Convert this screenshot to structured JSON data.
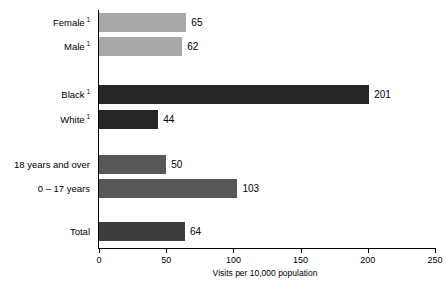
{
  "chart_data": {
    "type": "bar",
    "orientation": "horizontal",
    "title": "",
    "xlabel": "Visits per 10,000 population",
    "ylabel": "",
    "xlim": [
      0,
      250
    ],
    "xticks": [
      0,
      50,
      100,
      150,
      200,
      250
    ],
    "grid": false,
    "legend": false,
    "categories": [
      "Female",
      "Male",
      "Black",
      "White",
      "18 years and over",
      "0 – 17 years",
      "Total"
    ],
    "values": [
      65,
      62,
      201,
      44,
      50,
      103,
      64
    ],
    "footnote_markers": [
      "1",
      "1",
      "1",
      "1",
      "",
      "",
      ""
    ],
    "bar_colors": [
      "#a8a8a8",
      "#a8a8a8",
      "#262626",
      "#262626",
      "#585858",
      "#585858",
      "#3d3d3d"
    ],
    "bars": [
      {
        "label": "Female",
        "marker": "1",
        "value": 65,
        "value_text": "65",
        "color": "#a8a8a8",
        "top": 13
      },
      {
        "label": "Male",
        "marker": "1",
        "value": 62,
        "value_text": "62",
        "color": "#a8a8a8",
        "top": 37
      },
      {
        "label": "Black",
        "marker": "1",
        "value": 201,
        "value_text": "201",
        "color": "#262626",
        "top": 85
      },
      {
        "label": "White",
        "marker": "1",
        "value": 44,
        "value_text": "44",
        "color": "#262626",
        "top": 110
      },
      {
        "label": "18 years and over",
        "marker": "",
        "value": 50,
        "value_text": "50",
        "color": "#585858",
        "top": 155
      },
      {
        "label": "0 – 17 years",
        "marker": "",
        "value": 103,
        "value_text": "103",
        "color": "#585858",
        "top": 179
      },
      {
        "label": "Total",
        "marker": "",
        "value": 64,
        "value_text": "64",
        "color": "#3d3d3d",
        "top": 222
      }
    ],
    "axis": {
      "x_origin_px": 99,
      "x_end_px": 435,
      "px_per_unit": 1.344,
      "baseline_px": 248,
      "tick_texts": [
        "0",
        "50",
        "100",
        "150",
        "200",
        "250"
      ]
    }
  }
}
